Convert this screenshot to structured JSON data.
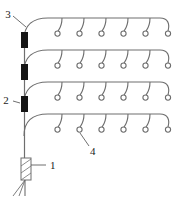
{
  "figure": {
    "background_color": "#ffffff",
    "line_color": "#6e6e6e",
    "valve_color": "#151515",
    "label_color": "#1a1a1a"
  },
  "labels": [
    {
      "id": "label-3",
      "text": "3",
      "x": 8,
      "y": 18,
      "points_to": "lateral-row-1-left-end"
    },
    {
      "id": "label-2",
      "text": "2",
      "x": 5,
      "y": 101,
      "points_to": "valve-3"
    },
    {
      "id": "label-1",
      "text": "1",
      "x": 48,
      "y": 165,
      "points_to": "pump-filter"
    },
    {
      "id": "label-4",
      "text": "4",
      "x": 89,
      "y": 150,
      "points_to": "emitter-row-4-2"
    }
  ],
  "components": {
    "main_line": {
      "name": "vertical-main-line",
      "x": 24,
      "y_top": 40,
      "y_bottom": 158
    },
    "valves": [
      {
        "name": "valve-1",
        "x": 21,
        "y": 32,
        "w": 7,
        "h": 16
      },
      {
        "name": "valve-2",
        "x": 21,
        "y": 64,
        "w": 7,
        "h": 16
      },
      {
        "name": "valve-3",
        "x": 21,
        "y": 96,
        "w": 7,
        "h": 16
      }
    ],
    "pump_filter": {
      "name": "pump-filter",
      "x": 21,
      "y": 158,
      "w": 10,
      "h": 22,
      "hatch_lines": 3
    },
    "lateral_rows": [
      {
        "name": "lateral-row-1",
        "y": 20,
        "emitters": 6
      },
      {
        "name": "lateral-row-2",
        "y": 52,
        "emitters": 6
      },
      {
        "name": "lateral-row-3",
        "y": 84,
        "emitters": 6
      },
      {
        "name": "lateral-row-4",
        "y": 116,
        "emitters": 6
      }
    ],
    "emitter": {
      "name": "emitter",
      "radius": 2.6,
      "count_per_row": 6
    },
    "intake_roots": {
      "name": "water-intake-lines",
      "count": 3
    }
  }
}
